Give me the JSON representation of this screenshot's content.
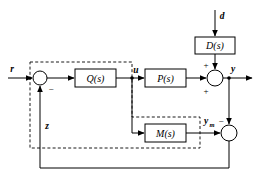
{
  "diagram": {
    "type": "control-system-block-diagram",
    "colors": {
      "line": "#000000",
      "background": "#ffffff",
      "block_fill": "#ffffff"
    },
    "blocks": [
      {
        "id": "D",
        "label": "D(s)",
        "x": 195,
        "y": 37,
        "width": 40,
        "height": 17
      },
      {
        "id": "Q",
        "label": "Q(s)",
        "x": 75,
        "y": 69,
        "width": 41,
        "height": 18
      },
      {
        "id": "P",
        "label": "P(s)",
        "x": 145,
        "y": 69,
        "width": 41,
        "height": 18
      },
      {
        "id": "M",
        "label": "M(s)",
        "x": 145,
        "y": 124,
        "width": 41,
        "height": 18
      }
    ],
    "summing_junctions": [
      {
        "id": "sum-error",
        "cx": 40,
        "cy": 78,
        "r": 7,
        "signs": [
          "-"
        ]
      },
      {
        "id": "sum-output",
        "cx": 215,
        "cy": 78,
        "r": 8,
        "signs": [
          "+",
          "+"
        ]
      },
      {
        "id": "sum-model",
        "cx": 229,
        "cy": 133,
        "r": 8,
        "signs": [
          "-"
        ]
      }
    ],
    "signals": [
      {
        "id": "r",
        "label": "r",
        "x": 12,
        "y": 72
      },
      {
        "id": "u",
        "label": "u",
        "x": 136,
        "y": 72
      },
      {
        "id": "d",
        "label": "d",
        "x": 221,
        "y": 17
      },
      {
        "id": "y",
        "label": "y",
        "x": 231,
        "y": 71
      },
      {
        "id": "z",
        "label": "z",
        "x": 47,
        "y": 128
      },
      {
        "id": "ym",
        "base": "y",
        "subscript": "m",
        "x": 206,
        "y": 121
      }
    ],
    "signs": [
      {
        "id": "sign-error-minus",
        "label": "−",
        "x": 51,
        "y": 92
      },
      {
        "id": "sign-output-top",
        "label": "+",
        "x": 205,
        "y": 66
      },
      {
        "id": "sign-output-left",
        "label": "+",
        "x": 205,
        "y": 93
      },
      {
        "id": "sign-model-minus",
        "label": "−",
        "x": 221,
        "y": 122
      }
    ],
    "dashed_region": {
      "id": "imc-controller-boundary",
      "path": "M 30 62 L 132 62 L 132 117 L 200 117 L 200 148 L 30 148 Z"
    }
  }
}
